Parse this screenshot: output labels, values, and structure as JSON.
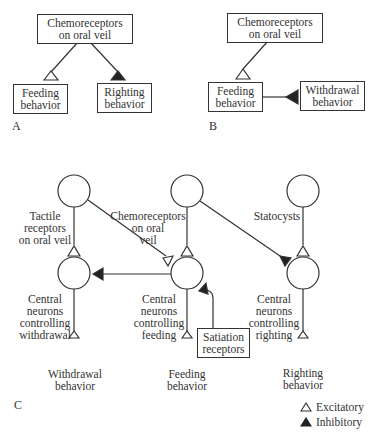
{
  "panels": {
    "A": {
      "label": "A",
      "nodes": {
        "chemo": {
          "line1": "Chemoreceptors",
          "line2": "on oral veil"
        },
        "feeding": {
          "line1": "Feeding",
          "line2": "behavior"
        },
        "righting": {
          "line1": "Righting",
          "line2": "behavior"
        }
      },
      "connections": [
        {
          "from": "chemo",
          "to": "feeding",
          "type": "excitatory"
        },
        {
          "from": "chemo",
          "to": "righting",
          "type": "inhibitory"
        }
      ]
    },
    "B": {
      "label": "B",
      "nodes": {
        "chemo": {
          "line1": "Chemoreceptors",
          "line2": "on oral veil"
        },
        "feeding": {
          "line1": "Feeding",
          "line2": "behavior"
        },
        "withdrawal": {
          "line1": "Withdrawal",
          "line2": "behavior"
        }
      },
      "connections": [
        {
          "from": "chemo",
          "to": "feeding",
          "type": "excitatory"
        },
        {
          "from": "withdrawal",
          "to": "feeding",
          "type": "inhibitory"
        }
      ]
    },
    "C": {
      "label": "C",
      "sensory": {
        "tactile": {
          "line1": "Tactile",
          "line2": "receptors",
          "line3": "on oral veil"
        },
        "chemo": {
          "line1": "Chemoreceptors",
          "line2": "on oral",
          "line3": "veil"
        },
        "statocysts": {
          "line1": "Statocysts"
        }
      },
      "central": {
        "withdrawal": {
          "line1": "Central",
          "line2": "neurons",
          "line3": "controlling",
          "line4": "withdrawal"
        },
        "feeding": {
          "line1": "Central",
          "line2": "neurons",
          "line3": "controlling",
          "line4": "feeding"
        },
        "righting": {
          "line1": "Central",
          "line2": "neurons",
          "line3": "controlling",
          "line4": "righting"
        }
      },
      "satiation": {
        "line1": "Satiation",
        "line2": "receptors"
      },
      "outputs": {
        "withdrawal": {
          "line1": "Withdrawal",
          "line2": "behavior"
        },
        "feeding": {
          "line1": "Feeding",
          "line2": "behavior"
        },
        "righting": {
          "line1": "Righting",
          "line2": "behavior"
        }
      },
      "connections": [
        {
          "from": "tactile",
          "to": "central-withdrawal",
          "type": "excitatory"
        },
        {
          "from": "chemo",
          "to": "central-feeding",
          "type": "excitatory"
        },
        {
          "from": "tactile",
          "to": "central-feeding",
          "type": "excitatory"
        },
        {
          "from": "chemo",
          "to": "central-righting",
          "type": "inhibitory"
        },
        {
          "from": "statocysts",
          "to": "central-righting",
          "type": "excitatory"
        },
        {
          "from": "central-feeding",
          "to": "central-withdrawal",
          "type": "inhibitory"
        },
        {
          "from": "satiation",
          "to": "central-feeding",
          "type": "inhibitory"
        },
        {
          "from": "central-withdrawal",
          "to": "withdrawal-behavior",
          "type": "excitatory"
        },
        {
          "from": "central-feeding",
          "to": "feeding-behavior",
          "type": "excitatory"
        },
        {
          "from": "central-righting",
          "to": "righting-behavior",
          "type": "excitatory"
        }
      ]
    }
  },
  "legend": {
    "excitatory": "Excitatory",
    "inhibitory": "Inhibitory"
  },
  "colors": {
    "stroke": "#333333",
    "fill_inhibitory": "#222222",
    "background": "#ffffff"
  }
}
